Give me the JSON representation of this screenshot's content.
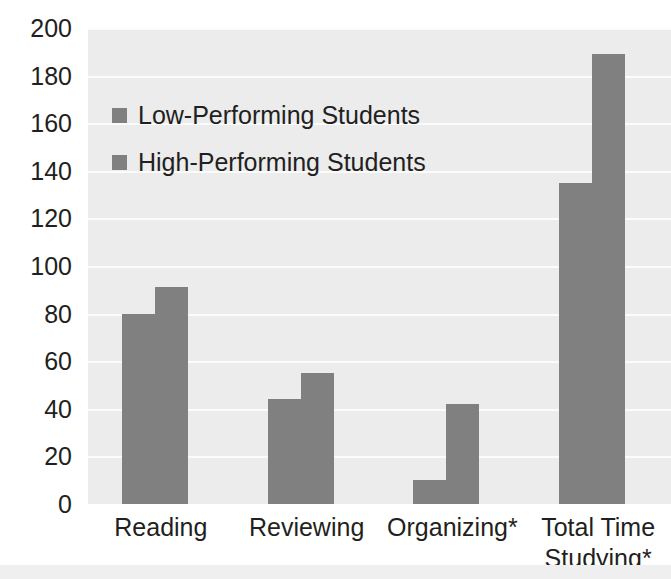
{
  "chart_data": {
    "type": "bar",
    "title": "",
    "xlabel": "",
    "ylabel": "",
    "categories": [
      "Reading",
      "Reviewing",
      "Organizing*",
      "Total Time Studying*"
    ],
    "category_lines": [
      [
        "Reading"
      ],
      [
        "Reviewing"
      ],
      [
        "Organizing*"
      ],
      [
        "Total Time",
        "Studying*"
      ]
    ],
    "series": [
      {
        "name": "Low-Performing Students",
        "values": [
          80,
          44,
          10,
          135
        ],
        "color": "#808080"
      },
      {
        "name": "High-Performing Students",
        "values": [
          91,
          55,
          42,
          189
        ],
        "color": "#808080"
      }
    ],
    "ylim": [
      0,
      200
    ],
    "ytick_step": 20,
    "yticks": [
      200,
      180,
      160,
      140,
      120,
      100,
      80,
      60,
      40,
      20,
      0
    ],
    "ytick_labels": [
      "200",
      "180",
      "160",
      "140",
      "120",
      "100",
      "80",
      "60",
      "40",
      "20",
      "0"
    ],
    "grid": true,
    "grid_color": "#fbfbfb",
    "legend_position": "upper-left",
    "plot_background": "#ececed",
    "text_color": "#231f20"
  },
  "legend": {
    "items": [
      {
        "label": "Low-Performing Students",
        "swatch": "legend-swatch-low"
      },
      {
        "label": "High-Performing Students",
        "swatch": "legend-swatch-high"
      }
    ]
  }
}
